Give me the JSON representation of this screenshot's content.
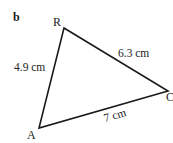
{
  "figure": {
    "part_label": "b",
    "vertices": [
      {
        "name": "R",
        "x": 64,
        "y": 28
      },
      {
        "name": "C",
        "x": 168,
        "y": 91
      },
      {
        "name": "A",
        "x": 39,
        "y": 128
      }
    ],
    "sides": [
      {
        "from": "A",
        "to": "R",
        "length": "4.9 cm"
      },
      {
        "from": "R",
        "to": "C",
        "length": "6.3 cm"
      },
      {
        "from": "A",
        "to": "C",
        "length": "7 cm"
      }
    ],
    "line_color": "#1a1a1a"
  }
}
